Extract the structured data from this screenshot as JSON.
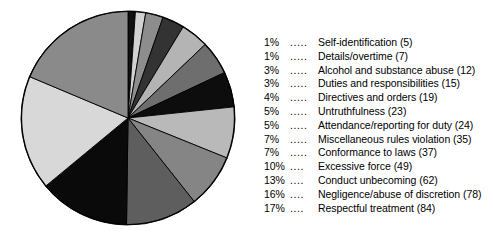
{
  "chart_data": {
    "type": "pie",
    "title": "",
    "subtitle": "",
    "xlabel": "",
    "ylabel": "",
    "grid": false,
    "legend_position": "right",
    "start_angle_clock_position": "12 o'clock",
    "direction": "clockwise",
    "total_count": 470,
    "categories": [
      "Self-identification",
      "Details/overtime",
      "Alcohol and substance abuse",
      "Duties and responsibilities",
      "Directives and orders",
      "Untruthfulness",
      "Attendance/reporting for duty",
      "Miscellaneous rules violation",
      "Conformance to laws",
      "Excessive force",
      "Conduct unbecoming",
      "Negligence/abuse of discretion",
      "Respectful treatment"
    ],
    "values": [
      5,
      7,
      12,
      15,
      19,
      23,
      24,
      35,
      37,
      49,
      62,
      78,
      84
    ],
    "percents": [
      1,
      1,
      3,
      3,
      4,
      5,
      5,
      7,
      7,
      10,
      13,
      16,
      17
    ],
    "slice_colors": [
      "#111111",
      "#d2d2d2",
      "#8d8d8d",
      "#4a4a4a",
      "#b4b4b4",
      "#2a2a2a",
      "#9a9a9a",
      "#cfcfcf",
      "#6e6e6e",
      "#0a0a0a",
      "#e6e6e6",
      "#7d7d7d",
      "#3a3a3a",
      "#a8a8a8"
    ],
    "slices": [
      {
        "percent_label": "1%",
        "dots": ".....",
        "label": "Self-identification (5)",
        "value": 5,
        "percent": 1,
        "color": "#111111"
      },
      {
        "percent_label": "1%",
        "dots": ".....",
        "label": "Details/overtime (7)",
        "value": 7,
        "percent": 1,
        "color": "#d2d2d2"
      },
      {
        "percent_label": "3%",
        "dots": ".....",
        "label": "Alcohol and substance abuse (12)",
        "value": 12,
        "percent": 3,
        "color": "#8d8d8d"
      },
      {
        "percent_label": "3%",
        "dots": ".....",
        "label": "Duties and responsibilities (15)",
        "value": 15,
        "percent": 3,
        "color": "#333333"
      },
      {
        "percent_label": "4%",
        "dots": ".....",
        "label": "Directives and orders (19)",
        "value": 19,
        "percent": 4,
        "color": "#b4b4b4"
      },
      {
        "percent_label": "5%",
        "dots": ".....",
        "label": "Untruthfulness (23)",
        "value": 23,
        "percent": 5,
        "color": "#6e6e6e"
      },
      {
        "percent_label": "5%",
        "dots": ".....",
        "label": "Attendance/reporting for duty (24)",
        "value": 24,
        "percent": 5,
        "color": "#0d0d0d"
      },
      {
        "percent_label": "7%",
        "dots": ".....",
        "label": "Miscellaneous rules violation (35)",
        "value": 35,
        "percent": 7,
        "color": "#b9b9b9"
      },
      {
        "percent_label": "7%",
        "dots": ".....",
        "label": "Conformance to laws (37)",
        "value": 37,
        "percent": 7,
        "color": "#858585"
      },
      {
        "percent_label": "10%",
        "dots": "....",
        "label": "Excessive force (49)",
        "value": 49,
        "percent": 10,
        "color": "#5e5e5e"
      },
      {
        "percent_label": "13%",
        "dots": "....",
        "label": "Conduct unbecoming (62)",
        "value": 62,
        "percent": 13,
        "color": "#0a0a0a"
      },
      {
        "percent_label": "16%",
        "dots": "....",
        "label": "Negligence/abuse of discretion (78)",
        "value": 78,
        "percent": 16,
        "color": "#d8d8d8"
      },
      {
        "percent_label": "17%",
        "dots": "....",
        "label": "Respectful treatment (84)",
        "value": 84,
        "percent": 17,
        "color": "#8a8a8a"
      }
    ],
    "pie_geometry": {
      "center_x": 108,
      "center_y": 108,
      "radius": 107,
      "outline_color": "#000000"
    }
  }
}
